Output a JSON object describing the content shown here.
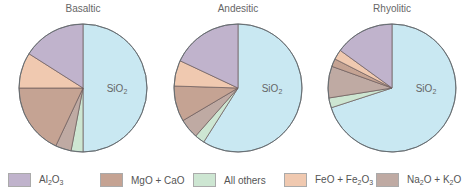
{
  "chart_data": [
    {
      "type": "pie",
      "title": "Basaltic",
      "slices": [
        {
          "label": "SiO2",
          "value": 50
        },
        {
          "label": "All others",
          "value": 3
        },
        {
          "label": "Na2O + K2O",
          "value": 4
        },
        {
          "label": "MgO + CaO",
          "value": 18
        },
        {
          "label": "FeO + Fe2O3",
          "value": 9
        },
        {
          "label": "Al2O3",
          "value": 16
        }
      ]
    },
    {
      "type": "pie",
      "title": "Andesitic",
      "slices": [
        {
          "label": "SiO2",
          "value": 59
        },
        {
          "label": "All others",
          "value": 2.5
        },
        {
          "label": "Na2O + K2O",
          "value": 5
        },
        {
          "label": "MgO + CaO",
          "value": 9
        },
        {
          "label": "FeO + Fe2O3",
          "value": 6.5
        },
        {
          "label": "Al2O3",
          "value": 18
        }
      ]
    },
    {
      "type": "pie",
      "title": "Rhyolitic",
      "slices": [
        {
          "label": "SiO2",
          "value": 70
        },
        {
          "label": "All others",
          "value": 2.5
        },
        {
          "label": "Na2O + K2O",
          "value": 8
        },
        {
          "label": "MgO + CaO",
          "value": 2
        },
        {
          "label": "FeO + Fe2O3",
          "value": 2.5
        },
        {
          "label": "Al2O3",
          "value": 15
        }
      ]
    }
  ],
  "slice_label": "SiO2",
  "colors": {
    "SiO2": "#c9e8f2",
    "All others": "#cde6d2",
    "Na2O + K2O": "#bfaaa3",
    "MgO + CaO": "#c5a393",
    "FeO + Fe2O3": "#f0c9b0",
    "Al2O3": "#c0b3cc"
  },
  "legend": [
    {
      "key": "Al2O3",
      "label_html": "Al<sub>2</sub>O<sub>3</sub>"
    },
    {
      "key": "MgO + CaO",
      "label_html": "MgO + CaO"
    },
    {
      "key": "All others",
      "label_html": "All others"
    },
    {
      "key": "FeO + Fe2O3",
      "label_html": "FeO + Fe<sub>2</sub>O<sub>3</sub>"
    },
    {
      "key": "Na2O + K2O",
      "label_html": "Na<sub>2</sub>O + K<sub>2</sub>O"
    }
  ]
}
